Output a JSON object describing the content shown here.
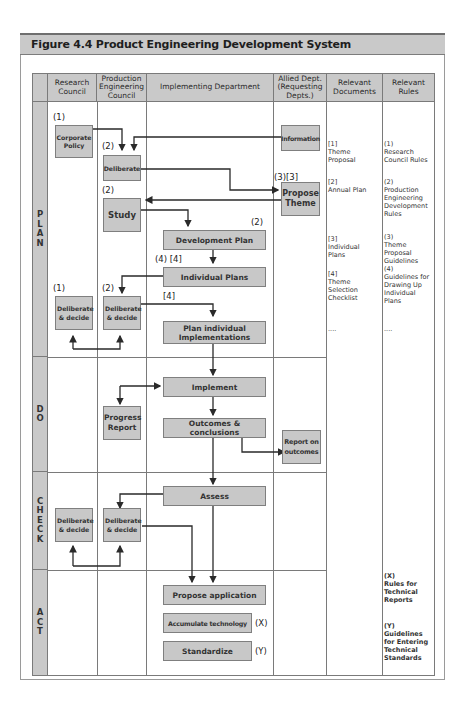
{
  "figure": {
    "title": "Figure 4.4 Product Engineering Development System"
  },
  "columns": [
    {
      "key": "phase",
      "label": ""
    },
    {
      "key": "research",
      "label": "Research Council"
    },
    {
      "key": "production",
      "label": "Production Engineering Council"
    },
    {
      "key": "implementing",
      "label": "Implementing Department"
    },
    {
      "key": "allied",
      "label": "Allied Dept. (Requesting Depts.)"
    },
    {
      "key": "documents",
      "label": "Relevant Documents"
    },
    {
      "key": "rules",
      "label": "Relevant Rules"
    }
  ],
  "phases": [
    {
      "key": "plan",
      "label": "P\nL\nA\nN"
    },
    {
      "key": "do",
      "label": "D\nO"
    },
    {
      "key": "check",
      "label": "C\nH\nE\nC\nK"
    },
    {
      "key": "act",
      "label": "A\nC\nT"
    }
  ],
  "boxes": {
    "corporate_policy": "Corporate Policy",
    "deliberate": "Deliberate",
    "information": "Information",
    "propose_theme": "Propose Theme",
    "study": "Study",
    "development_plan": "Development Plan",
    "individual_plans": "Individual Plans",
    "rc_deliberate_decide_plan": "Deliberate & decide",
    "pec_deliberate_decide_plan": "Deliberate & decide",
    "plan_individual_implementations": "Plan individual Implementations",
    "implement": "Implement",
    "progress_report": "Progress Report",
    "outcomes_conclusions": "Outcomes & conclusions",
    "report_on_outcomes": "Report on outcomes",
    "assess": "Assess",
    "rc_deliberate_decide_check": "Deliberate & decide",
    "pec_deliberate_decide_check": "Deliberate & decide",
    "propose_application": "Propose application",
    "accumulate_technology": "Accumulate technology",
    "standardize": "Standardize"
  },
  "markers": {
    "corporate_policy": "(1)",
    "deliberate": "(2)",
    "study": "(2)",
    "propose_theme": "(3)[3]",
    "development_plan": "(2)",
    "individual_plans": "(4) [4]",
    "plan_implementations": "[4]",
    "rc_deliberate_decide": "(1)",
    "pec_deliberate_decide": "(2)",
    "accumulate_technology": "(X)",
    "standardize": "(Y)"
  },
  "documents": [
    "[1]\nTheme\nProposal",
    "[2]\nAnnual Plan",
    "[3]\nIndividual\nPlans",
    "[4]\nTheme\nSelection\nChecklist",
    "...."
  ],
  "rules": {
    "plan": [
      "(1)\nResearch\nCouncil Rules",
      "(2)\nProduction\nEngineering\nDevelopment\nRules",
      "(3)\nTheme\nProposal\nGuidelines\n(4)\nGuidelines for\nDrawing Up\nIndividual\nPlans",
      "...."
    ],
    "act": [
      "(X)\nRules for\nTechnical\nReports",
      "(Y)\nGuidelines\nfor Entering\nTechnical\nStandards"
    ]
  },
  "colors": {
    "box_fill": "#c8c8c8",
    "header_fill": "#c9c9c9",
    "line": "#7a7a7a",
    "arrow": "#2a2a2a"
  }
}
